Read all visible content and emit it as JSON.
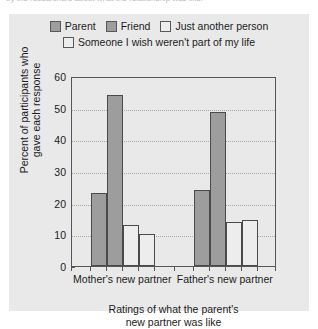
{
  "caption": {
    "text": "by the researchers about what the relationship was like."
  },
  "legend": {
    "position": "top",
    "rows": [
      [
        {
          "label": "Parent",
          "swatch": "#9d9d9d",
          "swatch_name": "legend-swatch-parent"
        },
        {
          "label": "Friend",
          "swatch": "#9d9d9d",
          "swatch_name": "legend-swatch-friend"
        },
        {
          "label": "Just another person",
          "swatch": "#ededed",
          "swatch_name": "legend-swatch-just-another-person"
        }
      ],
      [
        {
          "label": "Someone I wish weren't part of my life",
          "swatch": "#ededed",
          "swatch_name": "legend-swatch-someone-i-wish"
        }
      ]
    ]
  },
  "chart_data": {
    "type": "bar",
    "title": "",
    "categories": [
      "Mother's new partner",
      "Father's new partner"
    ],
    "series": [
      {
        "name": "Parent",
        "values": [
          23,
          24
        ],
        "color": "#9d9d9d"
      },
      {
        "name": "Friend",
        "values": [
          54,
          48.5
        ],
        "color": "#9d9d9d"
      },
      {
        "name": "Just another person",
        "values": [
          13,
          14
        ],
        "color": "#ededed"
      },
      {
        "name": "Someone I wish weren't part of my life",
        "values": [
          10,
          14.5
        ],
        "color": "#ededed"
      }
    ],
    "xlabel": "Ratings of what the parent's new partner was like",
    "xlabel_line1": "Ratings of what the parent's",
    "xlabel_line2": "new partner was like",
    "ylabel": "Percent of participants who gave each response",
    "ylabel_line1": "Percent of participants who",
    "ylabel_line2": "gave each response",
    "ylim": [
      0,
      60
    ],
    "yticks": [
      0,
      10,
      20,
      30,
      40,
      50,
      60
    ],
    "ytick_labels": [
      "0",
      "10",
      "20",
      "30",
      "40",
      "50",
      "60"
    ],
    "grid": true,
    "grid_style": "dotted-horizontal",
    "legend_position": "top"
  },
  "colors": {
    "panel_background": "#e9e9e9",
    "axis": "#555555",
    "bar_outline": "#4a4a4a",
    "bar_filled": "#9d9d9d",
    "bar_empty": "#ededed",
    "gridline": "#a8a8a8",
    "text": "#1c1c1c"
  }
}
